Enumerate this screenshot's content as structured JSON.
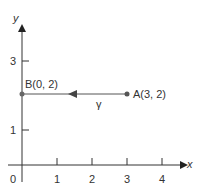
{
  "axes": {
    "x_label": "x",
    "y_label": "y",
    "origin_label": "0",
    "x_ticks": [
      "1",
      "2",
      "3",
      "4"
    ],
    "y_ticks": [
      "1",
      "3"
    ]
  },
  "points": {
    "A": {
      "label": "A(3, 2)"
    },
    "B": {
      "label": "B(0, 2)"
    }
  },
  "path": {
    "label": "γ"
  },
  "colors": {
    "axis": "#333333",
    "path": "#555555",
    "point": "#666666"
  }
}
